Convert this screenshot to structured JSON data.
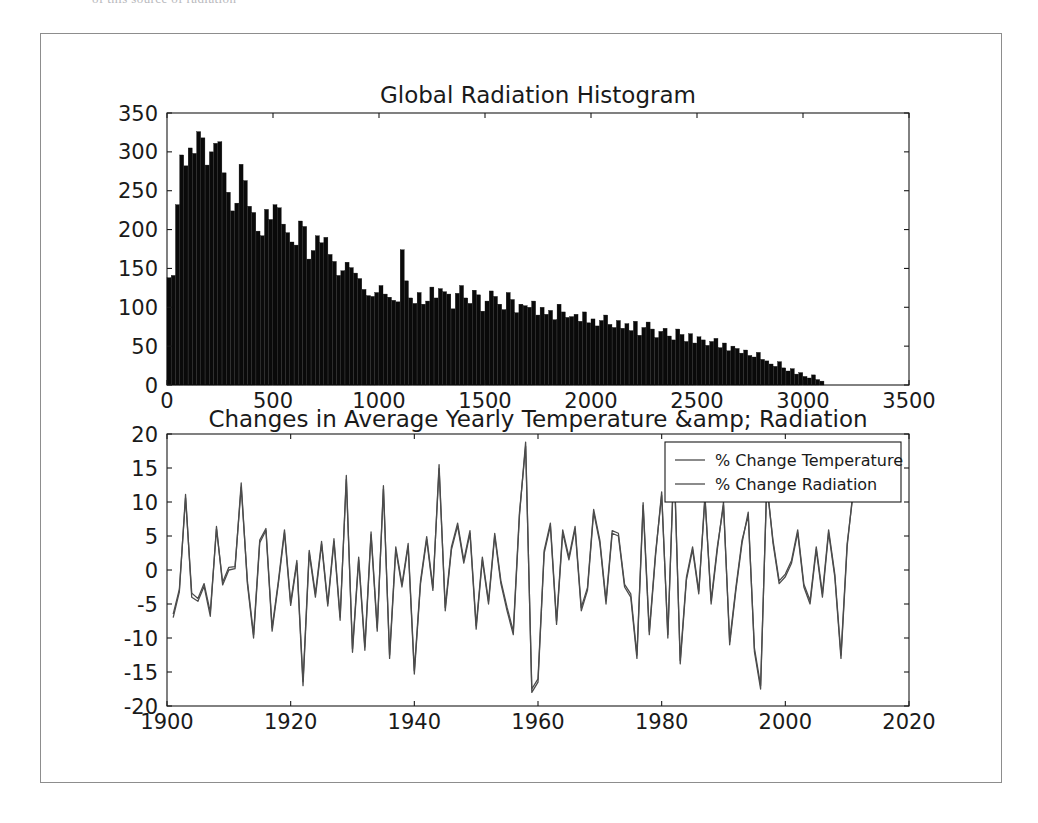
{
  "page": {
    "clipped_top_text": "of this source of radiation",
    "background_color": "#ffffff",
    "frame_border_color": "#8d8d8d"
  },
  "figure": {
    "width": 962,
    "height": 750,
    "facecolor": "#ffffff"
  },
  "chart_data": [
    {
      "id": "global-radiation-histogram",
      "type": "bar",
      "title": "Global Radiation Histogram",
      "xlabel": "",
      "ylabel": "",
      "grid": false,
      "legend_position": "none",
      "bar_color": "#0a0a0a",
      "edge_color": "#0a0a0a",
      "xlim": [
        0,
        3500
      ],
      "ylim": [
        0,
        350
      ],
      "xticks": [
        0,
        500,
        1000,
        1500,
        2000,
        2500,
        3000,
        3500
      ],
      "yticks": [
        0,
        50,
        100,
        150,
        200,
        250,
        300,
        350
      ],
      "xticklabels": [
        "0",
        "500",
        "1000",
        "1500",
        "2000",
        "2500",
        "3000",
        "3500"
      ],
      "yticklabels": [
        "0",
        "50",
        "100",
        "150",
        "200",
        "250",
        "300",
        "350"
      ],
      "bin_width": 20,
      "bin_starts": [
        0,
        20,
        40,
        60,
        80,
        100,
        120,
        140,
        160,
        180,
        200,
        220,
        240,
        260,
        280,
        300,
        320,
        340,
        360,
        380,
        400,
        420,
        440,
        460,
        480,
        500,
        520,
        540,
        560,
        580,
        600,
        620,
        640,
        660,
        680,
        700,
        720,
        740,
        760,
        780,
        800,
        820,
        840,
        860,
        880,
        900,
        920,
        940,
        960,
        980,
        1000,
        1020,
        1040,
        1060,
        1080,
        1100,
        1120,
        1140,
        1160,
        1180,
        1200,
        1220,
        1240,
        1260,
        1280,
        1300,
        1320,
        1340,
        1360,
        1380,
        1400,
        1420,
        1440,
        1460,
        1480,
        1500,
        1520,
        1540,
        1560,
        1580,
        1600,
        1620,
        1640,
        1660,
        1680,
        1700,
        1720,
        1740,
        1760,
        1780,
        1800,
        1820,
        1840,
        1860,
        1880,
        1900,
        1920,
        1940,
        1960,
        1980,
        2000,
        2020,
        2040,
        2060,
        2080,
        2100,
        2120,
        2140,
        2160,
        2180,
        2200,
        2220,
        2240,
        2260,
        2280,
        2300,
        2320,
        2340,
        2360,
        2380,
        2400,
        2420,
        2440,
        2460,
        2480,
        2500,
        2520,
        2540,
        2560,
        2580,
        2600,
        2620,
        2640,
        2660,
        2680,
        2700,
        2720,
        2740,
        2760,
        2780,
        2800,
        2820,
        2840,
        2860,
        2880,
        2900,
        2920,
        2940,
        2960,
        2980,
        3000,
        3020,
        3040,
        3060,
        3080
      ],
      "counts": [
        138,
        141,
        232,
        296,
        282,
        305,
        298,
        326,
        318,
        283,
        300,
        311,
        313,
        273,
        248,
        224,
        234,
        284,
        263,
        230,
        222,
        198,
        192,
        226,
        213,
        232,
        228,
        207,
        196,
        184,
        180,
        211,
        204,
        162,
        173,
        192,
        183,
        190,
        168,
        159,
        141,
        147,
        158,
        151,
        144,
        137,
        123,
        115,
        114,
        119,
        128,
        117,
        113,
        109,
        107,
        174,
        134,
        112,
        105,
        119,
        104,
        108,
        126,
        112,
        124,
        120,
        117,
        98,
        118,
        128,
        112,
        105,
        122,
        116,
        95,
        108,
        121,
        114,
        104,
        97,
        119,
        110,
        93,
        104,
        102,
        100,
        108,
        90,
        100,
        91,
        96,
        84,
        104,
        94,
        87,
        88,
        91,
        82,
        94,
        80,
        85,
        76,
        83,
        90,
        78,
        74,
        83,
        73,
        79,
        70,
        82,
        64,
        74,
        81,
        72,
        61,
        69,
        73,
        63,
        58,
        72,
        65,
        56,
        66,
        54,
        62,
        58,
        51,
        56,
        60,
        48,
        54,
        44,
        50,
        47,
        41,
        45,
        38,
        36,
        42,
        33,
        31,
        27,
        24,
        30,
        22,
        18,
        21,
        14,
        16,
        11,
        9,
        13,
        7,
        5,
        3,
        2,
        1
      ]
    },
    {
      "id": "yearly-change-lines",
      "type": "line",
      "title": "Changes in Average Yearly Temperature &amp; Radiation",
      "xlabel": "",
      "ylabel": "",
      "grid": false,
      "legend_position": "upper right",
      "xlim": [
        1900,
        2020
      ],
      "ylim": [
        -20,
        20
      ],
      "xticks": [
        1900,
        1920,
        1940,
        1960,
        1980,
        2000,
        2020
      ],
      "yticks": [
        -20,
        -15,
        -10,
        -5,
        0,
        5,
        10,
        15,
        20
      ],
      "xticklabels": [
        "1900",
        "1920",
        "1940",
        "1960",
        "1980",
        "2000",
        "2020"
      ],
      "yticklabels": [
        "-20",
        "-15",
        "-10",
        "-5",
        "0",
        "5",
        "10",
        "15",
        "20"
      ],
      "x": [
        1901,
        1902,
        1903,
        1904,
        1905,
        1906,
        1907,
        1908,
        1909,
        1910,
        1911,
        1912,
        1913,
        1914,
        1915,
        1916,
        1917,
        1918,
        1919,
        1920,
        1921,
        1922,
        1923,
        1924,
        1925,
        1926,
        1927,
        1928,
        1929,
        1930,
        1931,
        1932,
        1933,
        1934,
        1935,
        1936,
        1937,
        1938,
        1939,
        1940,
        1941,
        1942,
        1943,
        1944,
        1945,
        1946,
        1947,
        1948,
        1949,
        1950,
        1951,
        1952,
        1953,
        1954,
        1955,
        1956,
        1957,
        1958,
        1959,
        1960,
        1961,
        1962,
        1963,
        1964,
        1965,
        1966,
        1967,
        1968,
        1969,
        1970,
        1971,
        1972,
        1973,
        1974,
        1975,
        1976,
        1977,
        1978,
        1979,
        1980,
        1981,
        1982,
        1983,
        1984,
        1985,
        1986,
        1987,
        1988,
        1989,
        1990,
        1991,
        1992,
        1993,
        1994,
        1995,
        1996,
        1997,
        1998,
        1999,
        2000,
        2001,
        2002,
        2003,
        2004,
        2005,
        2006,
        2007,
        2008,
        2009,
        2010,
        2011
      ],
      "series": [
        {
          "name": "% Change Temperature",
          "color": "#4c4c4c",
          "values": [
            -7.0,
            -3.2,
            11.1,
            -4.0,
            -4.6,
            -2.4,
            -6.8,
            6.4,
            -2.2,
            0.0,
            0.2,
            12.8,
            -2.0,
            -10.0,
            4.0,
            5.8,
            -9.0,
            -2.1,
            5.5,
            -5.2,
            1.0,
            -17.0,
            2.5,
            -4.0,
            3.8,
            -5.3,
            4.2,
            -7.4,
            13.9,
            -12.1,
            1.5,
            -11.8,
            5.2,
            -9.0,
            12.4,
            -13.0,
            3.0,
            -2.5,
            3.5,
            -15.3,
            -2.0,
            4.5,
            -3.0,
            15.5,
            -6.0,
            3.0,
            6.5,
            1.0,
            5.4,
            -8.7,
            1.5,
            -5.0,
            5.0,
            -2.0,
            -6.0,
            -9.5,
            8.0,
            18.8,
            -18.0,
            -16.5,
            2.5,
            6.5,
            -8.0,
            5.5,
            1.5,
            6.0,
            -6.0,
            -3.0,
            8.5,
            4.0,
            -5.0,
            5.4,
            5.0,
            -2.5,
            -4.0,
            -13.0,
            9.5,
            -9.5,
            2.0,
            11.5,
            -10.0,
            16.8,
            -13.8,
            -1.5,
            3.0,
            -3.5,
            11.0,
            -5.0,
            3.0,
            10.0,
            -11.0,
            -3.0,
            4.0,
            8.5,
            -12.0,
            -17.5,
            13.0,
            4.0,
            -2.0,
            -1.0,
            1.0,
            5.5,
            -2.5,
            -5.0,
            3.0,
            -4.0,
            5.5,
            -1.0,
            -13.0,
            3.5,
            12.0
          ]
        },
        {
          "name": "% Change Radiation",
          "color": "#4c4c4c",
          "values": [
            -6.5,
            -2.8,
            10.6,
            -3.4,
            -4.2,
            -2.0,
            -6.2,
            6.0,
            -1.8,
            0.4,
            0.5,
            12.2,
            -1.6,
            -9.5,
            4.4,
            6.1,
            -8.5,
            -1.7,
            5.9,
            -4.8,
            1.4,
            -16.4,
            2.9,
            -3.5,
            4.2,
            -4.9,
            4.6,
            -6.9,
            13.3,
            -11.6,
            1.9,
            -11.3,
            5.6,
            -8.5,
            11.9,
            -12.5,
            3.4,
            -2.1,
            3.9,
            -14.8,
            -1.6,
            4.9,
            -2.6,
            14.9,
            -5.5,
            3.4,
            6.9,
            1.4,
            5.8,
            -8.2,
            1.9,
            -4.6,
            5.4,
            -1.6,
            -5.5,
            -9.0,
            8.4,
            18.2,
            -17.5,
            -16.0,
            2.9,
            6.9,
            -7.5,
            5.9,
            1.9,
            6.4,
            -5.5,
            -2.6,
            8.9,
            4.4,
            -4.5,
            5.8,
            5.4,
            -2.1,
            -3.5,
            -12.5,
            9.9,
            -9.0,
            2.4,
            11.0,
            -9.5,
            16.2,
            -13.3,
            -1.1,
            3.4,
            -3.1,
            10.5,
            -4.5,
            3.4,
            9.5,
            -10.5,
            -2.6,
            4.4,
            8.0,
            -11.5,
            -17.0,
            12.5,
            4.4,
            -1.6,
            -0.6,
            1.4,
            5.9,
            -2.1,
            -4.5,
            3.4,
            -3.5,
            5.9,
            -0.6,
            -12.5,
            3.9,
            11.5
          ]
        }
      ]
    }
  ]
}
